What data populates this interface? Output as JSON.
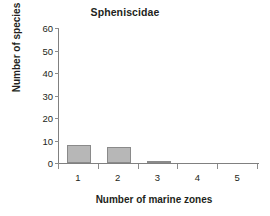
{
  "chart_data": {
    "type": "bar",
    "title": "Spheniscidae",
    "xlabel": "Number of marine zones",
    "ylabel": "Number of species",
    "categories": [
      "1",
      "2",
      "3",
      "4",
      "5"
    ],
    "values": [
      8,
      7,
      1,
      0,
      0
    ],
    "ylim": [
      0,
      60
    ],
    "yticks": [
      0,
      10,
      20,
      30,
      40,
      50,
      60
    ],
    "ytick_labels": [
      "0",
      "10",
      "20",
      "30",
      "40",
      "50",
      "60"
    ],
    "grid": false,
    "legend": false,
    "legend_position": "none",
    "bar_fill_color": "#b7b7b7",
    "bar_edge_color": "#8a8a8a",
    "axis_color": "#808080",
    "text_color": "#231f20",
    "background_color": "#ffffff"
  }
}
